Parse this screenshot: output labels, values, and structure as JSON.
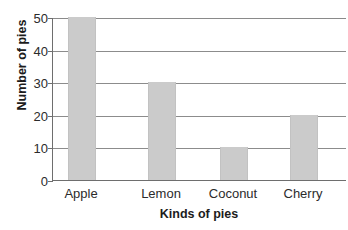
{
  "chart_data": {
    "type": "bar",
    "title": "",
    "title_clipped": true,
    "categories": [
      "Apple",
      "Lemon",
      "Coconut",
      "Cherry"
    ],
    "values": [
      50,
      30,
      10,
      20
    ],
    "xlabel": "Kinds of pies",
    "ylabel": "Number of pies",
    "ylim": [
      0,
      50
    ],
    "ytick_values": [
      50,
      40,
      30,
      20,
      10,
      0
    ],
    "ytick_labels": [
      "50",
      "40",
      "30",
      "20",
      "10",
      "0"
    ],
    "grid": "horizontal",
    "legend": null,
    "bar_color": "#cbcbcb",
    "grid_color": "#8c8c8c",
    "axis_color": "#6e6e6e",
    "text_color": "#2b2b2b"
  },
  "figure": {
    "title_fragment": "",
    "background": "#ffffff"
  }
}
